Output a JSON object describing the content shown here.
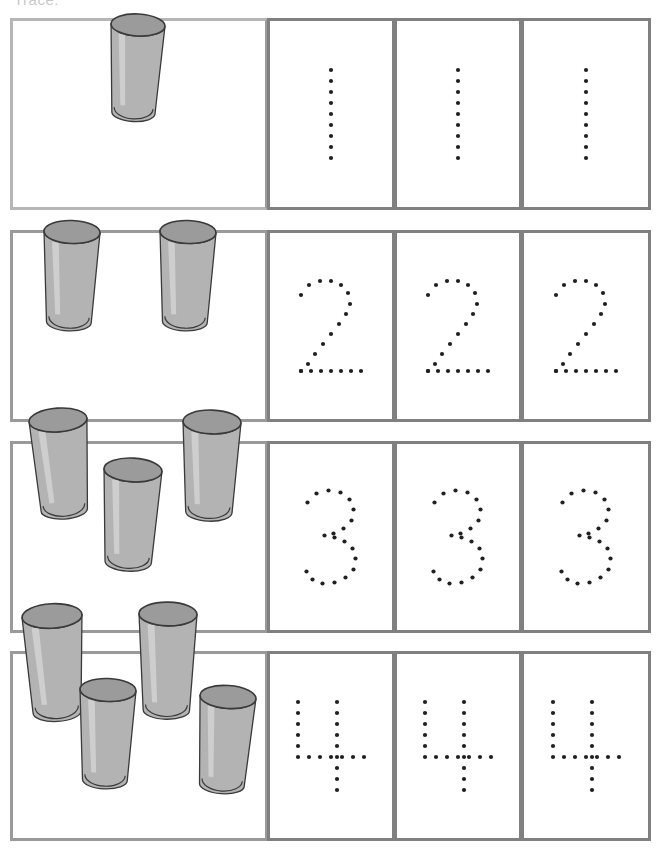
{
  "worksheet": {
    "title_clipped": "Trace:",
    "object_name": "drinking-glass",
    "object_count_label": "cups",
    "colors": {
      "grid_border": "#9a9a9a",
      "grid_border_light": "#b6b6b6",
      "cup_fill": "#b3b3b3",
      "cup_rim": "#9b9b9b",
      "cup_outline": "#3a3a3a",
      "dot": "#231f20",
      "page_background": "#ffffff"
    },
    "columns": [
      {
        "name": "objects",
        "label": "Count the cups"
      },
      {
        "name": "trace-1",
        "label": "Trace"
      },
      {
        "name": "trace-2",
        "label": "Trace"
      },
      {
        "name": "trace-3",
        "label": "Trace"
      }
    ],
    "rows": [
      {
        "number": 1,
        "numeral": "1",
        "cup_count": 1,
        "trace_repeats": 3,
        "cups": [
          {
            "x": 138,
            "y": 113,
            "w": 54,
            "h": 88,
            "rot": 3
          }
        ]
      },
      {
        "number": 2,
        "numeral": "2",
        "cup_count": 2,
        "trace_repeats": 3,
        "cups": [
          {
            "x": 72,
            "y": 322,
            "w": 56,
            "h": 90,
            "rot": 2
          },
          {
            "x": 188,
            "y": 322,
            "w": 56,
            "h": 90,
            "rot": 2
          }
        ]
      },
      {
        "number": 3,
        "numeral": "3",
        "cup_count": 3,
        "trace_repeats": 3,
        "cups": [
          {
            "x": 58,
            "y": 510,
            "w": 58,
            "h": 90,
            "rot": -4
          },
          {
            "x": 133,
            "y": 562,
            "w": 58,
            "h": 92,
            "rot": 3
          },
          {
            "x": 212,
            "y": 512,
            "w": 58,
            "h": 90,
            "rot": 2
          }
        ]
      },
      {
        "number": 4,
        "numeral": "4",
        "cup_count": 4,
        "trace_repeats": 3,
        "cups": [
          {
            "x": 52,
            "y": 712,
            "w": 60,
            "h": 96,
            "rot": -3
          },
          {
            "x": 108,
            "y": 780,
            "w": 56,
            "h": 90,
            "rot": 2
          },
          {
            "x": 168,
            "y": 710,
            "w": 58,
            "h": 96,
            "rot": 1
          },
          {
            "x": 228,
            "y": 785,
            "w": 56,
            "h": 88,
            "rot": 4
          }
        ]
      }
    ]
  },
  "numeral_dot_patterns": {
    "1": [
      [
        0,
        0
      ],
      [
        0,
        11
      ],
      [
        0,
        22
      ],
      [
        0,
        33
      ],
      [
        0,
        44
      ],
      [
        0,
        55
      ],
      [
        0,
        66
      ],
      [
        0,
        77
      ],
      [
        0,
        88
      ]
    ],
    "2": [
      [
        2,
        16
      ],
      [
        10,
        6
      ],
      [
        21,
        2
      ],
      [
        32,
        2
      ],
      [
        42,
        6
      ],
      [
        49,
        14
      ],
      [
        51,
        25
      ],
      [
        47,
        35
      ],
      [
        40,
        45
      ],
      [
        32,
        55
      ],
      [
        24,
        65
      ],
      [
        16,
        75
      ],
      [
        9,
        85
      ],
      [
        2,
        92
      ],
      [
        2,
        92
      ],
      [
        12,
        92
      ],
      [
        22,
        92
      ],
      [
        32,
        92
      ],
      [
        42,
        92
      ],
      [
        52,
        92
      ],
      [
        62,
        92
      ]
    ],
    "3": [
      [
        4,
        14
      ],
      [
        13,
        5
      ],
      [
        25,
        2
      ],
      [
        37,
        4
      ],
      [
        46,
        11
      ],
      [
        50,
        21
      ],
      [
        48,
        32
      ],
      [
        40,
        40
      ],
      [
        30,
        45
      ],
      [
        21,
        47
      ],
      [
        31,
        49
      ],
      [
        41,
        53
      ],
      [
        49,
        60
      ],
      [
        52,
        70
      ],
      [
        50,
        81
      ],
      [
        42,
        89
      ],
      [
        31,
        94
      ],
      [
        19,
        95
      ],
      [
        9,
        91
      ],
      [
        3,
        83
      ]
    ],
    "4": [
      [
        2,
        2
      ],
      [
        2,
        13
      ],
      [
        2,
        24
      ],
      [
        2,
        35
      ],
      [
        2,
        46
      ],
      [
        2,
        57
      ],
      [
        13,
        57
      ],
      [
        24,
        57
      ],
      [
        35,
        57
      ],
      [
        46,
        57
      ],
      [
        57,
        57
      ],
      [
        68,
        57
      ],
      [
        41,
        2
      ],
      [
        41,
        13
      ],
      [
        41,
        24
      ],
      [
        41,
        35
      ],
      [
        41,
        46
      ],
      [
        41,
        57
      ],
      [
        41,
        68
      ],
      [
        41,
        79
      ],
      [
        41,
        90
      ]
    ]
  }
}
